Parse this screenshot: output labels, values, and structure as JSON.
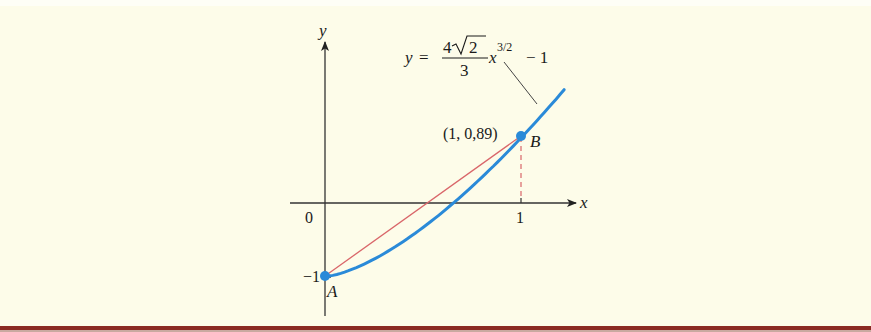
{
  "figure": {
    "axes": {
      "x_label": "x",
      "y_label": "y",
      "origin_label": "0",
      "x_tick_label": "1",
      "y_tick_label": "−1"
    },
    "equation": {
      "lhs": "y =",
      "numerator_coeff": "4",
      "radicand": "2",
      "denominator": "3",
      "variable": "x",
      "exponent": "3/2",
      "tail": "− 1"
    },
    "points": [
      {
        "name": "A",
        "label": "A",
        "coords": [
          0,
          -1
        ]
      },
      {
        "name": "B",
        "label": "B",
        "coords": [
          1,
          0.89
        ],
        "coord_label": "(1, 0,89)"
      }
    ],
    "colors": {
      "curve": "#2a8ad8",
      "chord": "#d9666a",
      "point": "#2a8ad8",
      "dashed": "#d9666a",
      "axis": "#333333",
      "background": "#fdfce9",
      "bottom_rule": "#8b2a22"
    }
  },
  "chart_data": {
    "type": "line",
    "title": "",
    "xlabel": "x",
    "ylabel": "y",
    "series": [
      {
        "name": "y = (4√2/3) x^(3/2) − 1",
        "x": [
          0,
          0.1,
          0.2,
          0.3,
          0.4,
          0.5,
          0.6,
          0.7,
          0.8,
          0.9,
          1.0,
          1.1,
          1.22
        ],
        "values": [
          -1,
          -0.94,
          -0.83,
          -0.69,
          -0.52,
          -0.33,
          -0.12,
          0.1,
          0.35,
          0.61,
          0.89,
          1.18,
          1.54
        ]
      },
      {
        "name": "chord AB",
        "x": [
          0,
          1
        ],
        "values": [
          -1,
          0.89
        ]
      }
    ],
    "annotations": [
      "A (0, −1)",
      "B (1, 0,89)",
      "y = (4√2/3) x^(3/2) − 1"
    ],
    "x_ticks": [
      "0",
      "1"
    ],
    "y_ticks": [
      "−1"
    ],
    "grid": false
  }
}
